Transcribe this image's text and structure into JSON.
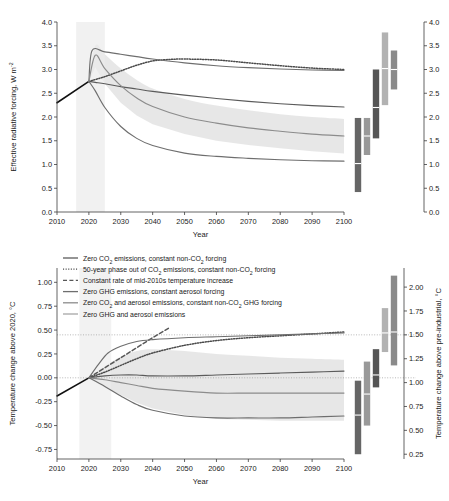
{
  "figure": {
    "xlabel": "Year",
    "x_ticks": [
      "2010",
      "2020",
      "2030",
      "2040",
      "2050",
      "2060",
      "2070",
      "2080",
      "2090",
      "2100"
    ],
    "legend": {
      "position": "upper-left-of-bottom-panel",
      "entries": [
        {
          "label_parts": [
            "Zero CO",
            "2",
            " emissions, constant non-CO",
            "2",
            " forcing"
          ],
          "style": "solid",
          "color": "#5b5b5b",
          "key": "zero-co2"
        },
        {
          "label_parts": [
            "50-year phase out of CO",
            "2",
            " emissions, constant non-CO",
            "2",
            " forcing"
          ],
          "style": "dotted",
          "color": "#4a4a4a",
          "key": "phase-out-co2"
        },
        {
          "label_parts": [
            "Constant rate of mid-2010s temperature increase"
          ],
          "style": "dashed",
          "color": "#575757",
          "key": "constant-rate"
        },
        {
          "label_parts": [
            "Zero GHG emissions, constant aerosol forcing"
          ],
          "style": "solid",
          "color": "#6e6e6e",
          "key": "zero-ghg"
        },
        {
          "label_parts": [
            "Zero CO",
            "2",
            " and aerosol emissions, constant non-CO",
            "2",
            " GHG forcing"
          ],
          "style": "solid",
          "color": "#8c8c8c",
          "key": "zero-co2-aerosol"
        },
        {
          "label_parts": [
            "Zero GHG and aerosol emissions"
          ],
          "style": "solid",
          "color": "#a6a6a6",
          "key": "zero-ghg-aerosol"
        }
      ]
    }
  },
  "chart_data": [
    {
      "id": "top-panel",
      "type": "line",
      "title": "",
      "xlabel": "Year",
      "ylabel": "Effective radiative forcing, W m",
      "ylabel_sup": "-2",
      "xlim": [
        2010,
        2100
      ],
      "ylim": [
        0.0,
        4.0
      ],
      "y_ticks": [
        "0.0",
        "0.5",
        "1.0",
        "1.5",
        "2.0",
        "2.5",
        "3.0",
        "3.5",
        "4.0"
      ],
      "y_tick_values": [
        0.0,
        0.5,
        1.0,
        1.5,
        2.0,
        2.5,
        3.0,
        3.5,
        4.0
      ],
      "right_axis": {
        "ylim": [
          0.0,
          4.0
        ],
        "ticks": [
          "0.0",
          "0.5",
          "1.0",
          "1.5",
          "2.0",
          "2.5",
          "3.0",
          "3.5",
          "4.0"
        ]
      },
      "grid": false,
      "historical": {
        "x": [
          2010,
          2020
        ],
        "y": [
          2.3,
          2.75
        ],
        "color": "#111111"
      },
      "series": [
        {
          "name": "zero-co2",
          "color": "#5b5b5b",
          "style": "solid",
          "x": [
            2020,
            2022,
            2025,
            2030,
            2035,
            2040,
            2050,
            2060,
            2070,
            2080,
            2090,
            2100
          ],
          "y": [
            2.75,
            2.73,
            2.7,
            2.64,
            2.59,
            2.54,
            2.46,
            2.39,
            2.33,
            2.28,
            2.24,
            2.21
          ]
        },
        {
          "name": "phase-out-co2",
          "color": "#4a4a4a",
          "style": "dotted",
          "x": [
            2020,
            2025,
            2030,
            2035,
            2040,
            2045,
            2050,
            2060,
            2070,
            2080,
            2090,
            2100
          ],
          "y": [
            2.75,
            2.85,
            2.97,
            3.09,
            3.18,
            3.21,
            3.22,
            3.2,
            3.14,
            3.08,
            3.03,
            3.0
          ]
        },
        {
          "name": "zero-ghg",
          "color": "#6e6e6e",
          "style": "solid",
          "x": [
            2020,
            2021,
            2025,
            2030,
            2035,
            2040,
            2050,
            2060,
            2070,
            2080,
            2090,
            2100
          ],
          "y": [
            2.75,
            3.4,
            3.37,
            3.32,
            3.27,
            3.22,
            3.14,
            3.08,
            3.04,
            3.01,
            2.99,
            2.98
          ]
        },
        {
          "name": "zero-co2-aerosol",
          "color": "#8c8c8c",
          "style": "solid",
          "x": [
            2020,
            2022,
            2025,
            2030,
            2035,
            2040,
            2050,
            2060,
            2070,
            2080,
            2090,
            2100
          ],
          "y": [
            2.75,
            3.3,
            3.02,
            2.66,
            2.4,
            2.22,
            2.0,
            1.87,
            1.77,
            1.7,
            1.64,
            1.6
          ],
          "band_lo": [
            2.75,
            3.05,
            2.7,
            2.3,
            2.03,
            1.85,
            1.64,
            1.5,
            1.41,
            1.34,
            1.28,
            1.23
          ],
          "band_hi": [
            2.75,
            3.5,
            3.32,
            3.02,
            2.78,
            2.6,
            2.38,
            2.24,
            2.14,
            2.06,
            2.0,
            1.96
          ]
        },
        {
          "name": "zero-ghg-aerosol",
          "color": "#6e6e6e",
          "style": "solid",
          "x": [
            2020,
            2022,
            2025,
            2030,
            2035,
            2040,
            2050,
            2060,
            2070,
            2080,
            2090,
            2100
          ],
          "y": [
            2.75,
            2.55,
            2.2,
            1.8,
            1.55,
            1.4,
            1.24,
            1.17,
            1.13,
            1.1,
            1.08,
            1.07
          ]
        }
      ],
      "uncertainty_bars": [
        {
          "key": "zero-co2",
          "x_pos": 2104,
          "low": 0.42,
          "high": 1.98,
          "mid": 1.02,
          "color": "#666666"
        },
        {
          "key": "phase-out-co2",
          "x_pos": 2108,
          "low": 1.2,
          "high": 1.98,
          "mid": 1.6,
          "color": "#999999"
        },
        {
          "key": "zero-ghg",
          "x_pos": 2112,
          "low": 1.55,
          "high": 3.0,
          "mid": 2.2,
          "color": "#555555"
        },
        {
          "key": "zero-co2-aerosol",
          "x_pos": 2116,
          "low": 2.25,
          "high": 3.78,
          "mid": 3.02,
          "color": "#b2b2b2"
        },
        {
          "key": "zero-ghg-aerosol",
          "x_pos": 2120,
          "low": 2.58,
          "high": 3.4,
          "mid": 3.0,
          "color": "#8a8a8a"
        }
      ]
    },
    {
      "id": "bottom-panel",
      "type": "line",
      "title": "",
      "xlabel": "Year",
      "ylabel": "Temperature change above 2020, °C",
      "xlim": [
        2010,
        2100
      ],
      "ylim": [
        -0.85,
        1.15
      ],
      "y_ticks": [
        "-0.75",
        "-0.50",
        "-0.25",
        "0.00",
        "0.25",
        "0.50",
        "0.75",
        "1.00"
      ],
      "y_tick_values": [
        -0.75,
        -0.5,
        -0.25,
        0.0,
        0.25,
        0.5,
        0.75,
        1.0
      ],
      "right_axis": {
        "ylabel": "Temperature change above pre-industrial, °C",
        "ticks": [
          "0.25",
          "0.50",
          "0.75",
          "1.00",
          "1.25",
          "1.50",
          "1.75",
          "2.00"
        ],
        "tick_values": [
          0.25,
          0.5,
          0.75,
          1.0,
          1.25,
          1.5,
          1.75,
          2.0
        ],
        "offset": 1.05
      },
      "grid": false,
      "guides": [
        {
          "y": 0.0,
          "label": ""
        },
        {
          "y": 0.45,
          "label": ""
        }
      ],
      "historical": {
        "x": [
          2010,
          2020
        ],
        "y": [
          -0.19,
          0.0
        ],
        "color": "#111111"
      },
      "series": [
        {
          "name": "zero-co2",
          "color": "#5b5b5b",
          "style": "solid",
          "x": [
            2020,
            2025,
            2030,
            2035,
            2040,
            2050,
            2060,
            2070,
            2080,
            2090,
            2100
          ],
          "y": [
            0.0,
            0.02,
            0.03,
            0.03,
            0.02,
            0.02,
            0.03,
            0.04,
            0.05,
            0.06,
            0.07
          ]
        },
        {
          "name": "phase-out-co2",
          "color": "#4a4a4a",
          "style": "dotted",
          "x": [
            2020,
            2025,
            2030,
            2035,
            2040,
            2050,
            2060,
            2070,
            2080,
            2090,
            2100
          ],
          "y": [
            0.0,
            0.06,
            0.13,
            0.2,
            0.26,
            0.34,
            0.39,
            0.42,
            0.44,
            0.46,
            0.48
          ]
        },
        {
          "name": "constant-rate",
          "color": "#575757",
          "style": "dashed",
          "x": [
            2020,
            2030,
            2040,
            2045
          ],
          "y": [
            0.0,
            0.21,
            0.42,
            0.52
          ]
        },
        {
          "name": "zero-ghg",
          "color": "#6e6e6e",
          "style": "solid",
          "x": [
            2020,
            2023,
            2026,
            2030,
            2035,
            2040,
            2050,
            2060,
            2070,
            2080,
            2090,
            2100
          ],
          "y": [
            0.0,
            0.14,
            0.26,
            0.33,
            0.38,
            0.4,
            0.42,
            0.43,
            0.44,
            0.45,
            0.46,
            0.47
          ]
        },
        {
          "name": "zero-co2-aerosol",
          "color": "#8c8c8c",
          "style": "solid",
          "x": [
            2020,
            2025,
            2030,
            2035,
            2040,
            2050,
            2060,
            2070,
            2080,
            2090,
            2100
          ],
          "y": [
            0.0,
            -0.02,
            -0.05,
            -0.08,
            -0.11,
            -0.14,
            -0.16,
            -0.16,
            -0.16,
            -0.16,
            -0.16
          ],
          "band_lo": [
            0.0,
            -0.1,
            -0.18,
            -0.26,
            -0.32,
            -0.39,
            -0.43,
            -0.44,
            -0.45,
            -0.45,
            -0.45
          ],
          "band_hi": [
            0.0,
            0.12,
            0.22,
            0.28,
            0.3,
            0.28,
            0.25,
            0.23,
            0.21,
            0.2,
            0.19
          ]
        },
        {
          "name": "zero-ghg-aerosol",
          "color": "#6e6e6e",
          "style": "solid",
          "x": [
            2020,
            2025,
            2030,
            2035,
            2040,
            2050,
            2060,
            2070,
            2080,
            2090,
            2100
          ],
          "y": [
            0.0,
            -0.09,
            -0.19,
            -0.28,
            -0.34,
            -0.4,
            -0.42,
            -0.42,
            -0.42,
            -0.41,
            -0.4
          ]
        }
      ],
      "uncertainty_bars": [
        {
          "key": "zero-co2",
          "x_pos": 2104,
          "low": 0.25,
          "high": 1.02,
          "mid": 0.66,
          "color": "#666666"
        },
        {
          "key": "phase-out-co2",
          "x_pos": 2108,
          "low": 0.55,
          "high": 1.22,
          "mid": 0.88,
          "color": "#999999"
        },
        {
          "key": "zero-ghg",
          "x_pos": 2112,
          "low": 0.95,
          "high": 1.35,
          "mid": 1.08,
          "color": "#555555"
        },
        {
          "key": "zero-co2-aerosol",
          "x_pos": 2116,
          "low": 1.32,
          "high": 1.78,
          "mid": 1.52,
          "color": "#b2b2b2"
        },
        {
          "key": "zero-ghg-aerosol",
          "x_pos": 2120,
          "low": 1.18,
          "high": 2.12,
          "mid": 1.53,
          "color": "#8a8a8a"
        }
      ]
    }
  ]
}
